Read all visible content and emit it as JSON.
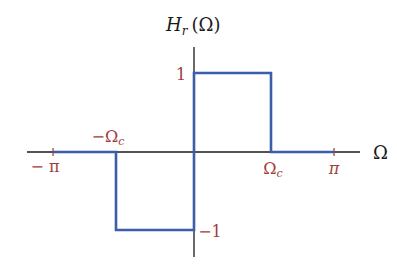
{
  "diagram": {
    "title": "Hr(Ω)",
    "colors": {
      "axis": "#1a1a1a",
      "signal": "#3b5ea8",
      "tick_label": "#a23c3c",
      "background": "#ffffff"
    },
    "y_axis": {
      "label_main": "H",
      "label_sub": "r",
      "label_arg": "(Ω)",
      "ticks": [
        {
          "label": "1",
          "value": 1
        },
        {
          "label": "−1",
          "value": -1
        }
      ]
    },
    "x_axis": {
      "label": "Ω",
      "ticks": [
        {
          "label": "− π",
          "value": -3.1416
        },
        {
          "label": "−Ω",
          "sub": "c",
          "value": -1.5
        },
        {
          "label": "Ω",
          "sub": "c",
          "value": 1.5
        },
        {
          "label": "π",
          "value": 3.1416
        }
      ]
    },
    "signal": {
      "description": "Piecewise: 0 on [−π, −Ωc), −1 on [−Ωc, 0), 1 on [0, Ωc), 0 on [Ωc, π]",
      "segments": [
        {
          "from": "-π",
          "to": "-Ωc",
          "value": 0
        },
        {
          "from": "-Ωc",
          "to": "0",
          "value": -1
        },
        {
          "from": "0",
          "to": "Ωc",
          "value": 1
        },
        {
          "from": "Ωc",
          "to": "π",
          "value": 0
        }
      ]
    }
  }
}
